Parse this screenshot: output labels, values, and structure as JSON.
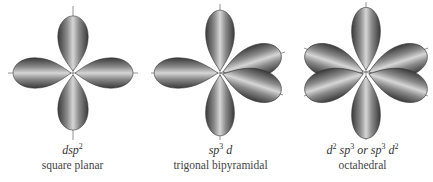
{
  "figures": [
    {
      "id": "square-planar",
      "formula_parts": [
        {
          "t": "dsp"
        },
        {
          "sup": "2"
        }
      ],
      "formula_text": "dsp²",
      "geometry": "square planar",
      "lobe_count": 4
    },
    {
      "id": "trigonal-bipyramidal",
      "formula_parts": [
        {
          "t": "sp"
        },
        {
          "sup": "3"
        },
        {
          "t": " d"
        }
      ],
      "formula_text": "sp³ d",
      "geometry": "trigonal bipyramidal",
      "lobe_count": 5
    },
    {
      "id": "octahedral",
      "formula_parts": [
        {
          "t": "d"
        },
        {
          "sup": "2"
        },
        {
          "t": " sp"
        },
        {
          "sup": "3"
        },
        {
          "t": " or sp"
        },
        {
          "sup": "3"
        },
        {
          "t": " d"
        },
        {
          "sup": "2"
        }
      ],
      "formula_text": "d²sp³ or sp³d²",
      "geometry": "octahedral",
      "lobe_count": 6
    }
  ],
  "colors": {
    "lobe_dark": "#3a3a3a",
    "lobe_light": "#d8d8d8",
    "axis": "#777777"
  }
}
